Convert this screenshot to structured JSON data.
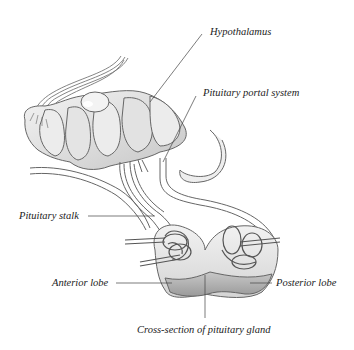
{
  "diagram": {
    "colors": {
      "stroke": "#555555",
      "fill_light": "#e6e6e6",
      "fill_mid": "#cfcfcf",
      "fill_dark": "#a9a9a9",
      "leader_line": "#444444",
      "text": "#222222"
    },
    "labels": {
      "hypothalamus": "Hypothalamus",
      "portal_system": "Pituitary portal system",
      "stalk": "Pituitary stalk",
      "anterior_lobe": "Anterior lobe",
      "posterior_lobe": "Posterior lobe",
      "cross_section": "Cross-section of pituitary gland"
    }
  }
}
